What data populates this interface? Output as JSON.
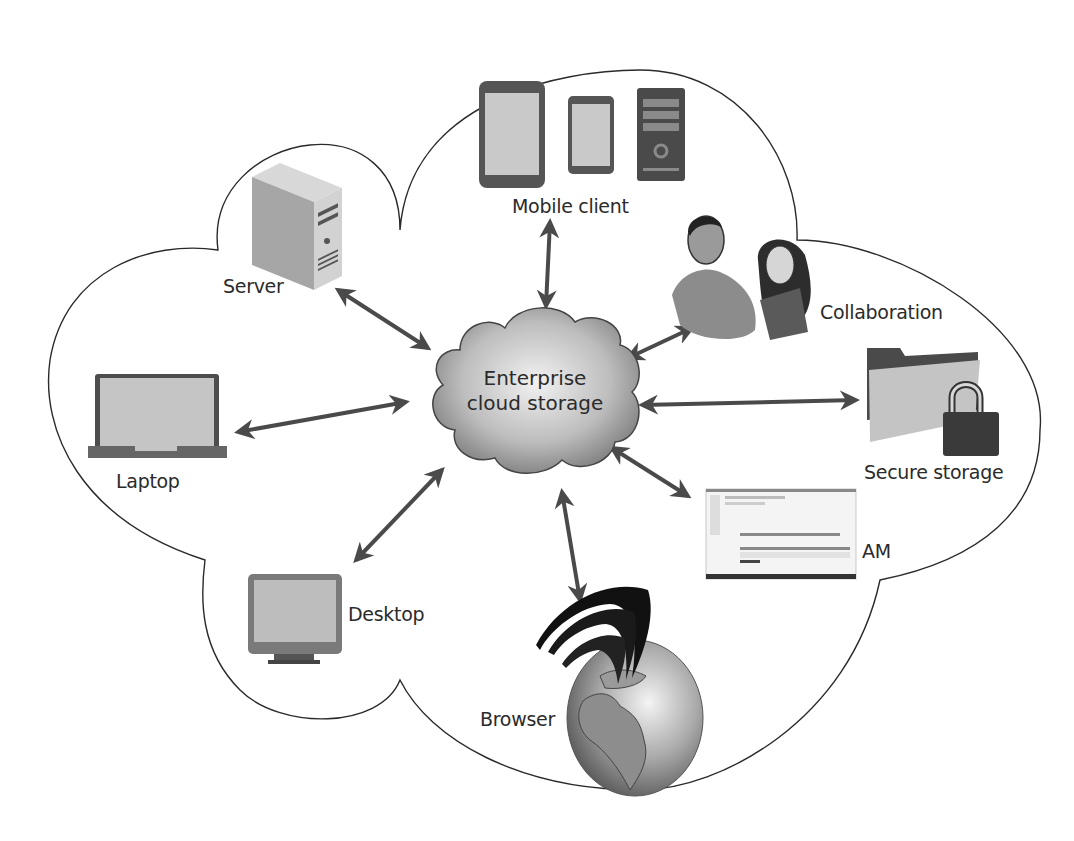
{
  "diagram": {
    "title": "Enterprise cloud storage",
    "center": {
      "line1": "Enterprise",
      "line2": "cloud storage"
    },
    "nodes": [
      {
        "id": "mobile",
        "label": "Mobile client",
        "icon": "mobile-devices-icon"
      },
      {
        "id": "server",
        "label": "Server",
        "icon": "server-tower-icon"
      },
      {
        "id": "collaboration",
        "label": "Collaboration",
        "icon": "people-icon"
      },
      {
        "id": "laptop",
        "label": "Laptop",
        "icon": "laptop-icon"
      },
      {
        "id": "secure",
        "label": "Secure storage",
        "icon": "locked-folder-icon"
      },
      {
        "id": "am",
        "label": "AM",
        "icon": "application-window-icon"
      },
      {
        "id": "desktop",
        "label": "Desktop",
        "icon": "desktop-monitor-icon"
      },
      {
        "id": "browser",
        "label": "Browser",
        "icon": "globe-icon"
      }
    ],
    "edges": [
      {
        "from": "center",
        "to": "mobile",
        "type": "bidirectional"
      },
      {
        "from": "center",
        "to": "server",
        "type": "bidirectional"
      },
      {
        "from": "center",
        "to": "collaboration",
        "type": "bidirectional"
      },
      {
        "from": "center",
        "to": "laptop",
        "type": "bidirectional"
      },
      {
        "from": "center",
        "to": "secure",
        "type": "bidirectional"
      },
      {
        "from": "center",
        "to": "am",
        "type": "bidirectional"
      },
      {
        "from": "center",
        "to": "desktop",
        "type": "bidirectional"
      },
      {
        "from": "center",
        "to": "browser",
        "type": "bidirectional"
      }
    ],
    "colors": {
      "outline": "#2a2a2a",
      "arrow": "#4a4a4a",
      "device_dark": "#4d4d4d",
      "device_light": "#c8c8c8",
      "background": "#ffffff"
    }
  }
}
